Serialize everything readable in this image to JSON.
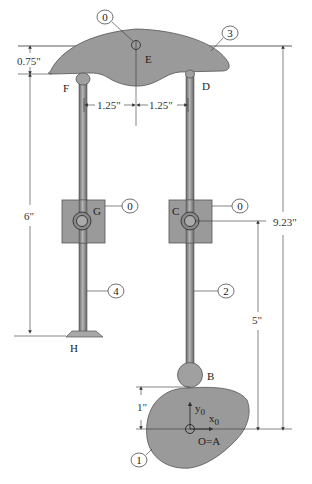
{
  "diagram": {
    "type": "cam-follower mechanism",
    "colors": {
      "part_fill": "#9a9a9a",
      "part_stroke": "#555555",
      "line": "#333333",
      "background": "#ffffff"
    },
    "points": {
      "E": "E",
      "F": "F",
      "D": "D",
      "G": "G",
      "C": "C",
      "H": "H",
      "B": "B",
      "origin": "O=A"
    },
    "axes": {
      "y": "y",
      "y_sub": "0",
      "x": "x",
      "x_sub": "0"
    },
    "part_labels": {
      "ground_top": "0",
      "rocker": "3",
      "ground_left_guide": "0",
      "ground_right_guide": "0",
      "left_rod": "4",
      "right_rod": "2",
      "cam": "1"
    },
    "dimensions": {
      "rocker_thickness": "0.75\"",
      "left_offset": "1.25\"",
      "right_offset": "1.25\"",
      "left_rod_length": "6\"",
      "total_height": "9.23\"",
      "guide_height": "5\"",
      "cam_rise": "1\""
    }
  }
}
